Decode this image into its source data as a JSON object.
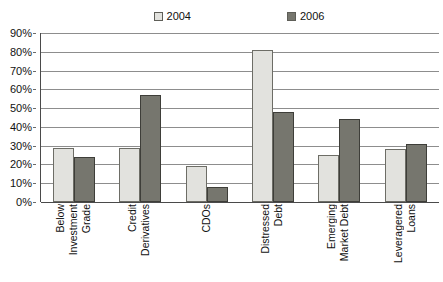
{
  "chart_data": {
    "type": "bar",
    "title": "",
    "subtitle": "",
    "xlabel": "",
    "ylabel": "",
    "ylim": [
      0,
      90
    ],
    "ytick_labels": [
      "90%",
      "80%",
      "70%",
      "60%",
      "50%",
      "40%",
      "30%",
      "20%",
      "10%",
      "0%"
    ],
    "ytick_values": [
      90,
      80,
      70,
      60,
      50,
      40,
      30,
      20,
      10,
      0
    ],
    "grid": true,
    "legend_position": "top",
    "categories": [
      "Below Investment Grade",
      "Credit Derivatives",
      "CDOs",
      "Distressed Debt",
      "Emerging Market Debt",
      "Leveragered Loans"
    ],
    "category_lines": [
      [
        "Below",
        "Investment",
        "Grade"
      ],
      [
        "Credit",
        "Derivatives"
      ],
      [
        "CDOs"
      ],
      [
        "Distressed",
        "Debt"
      ],
      [
        "Emerging",
        "Market Debt"
      ],
      [
        "Leveragered",
        "Loans"
      ]
    ],
    "series": [
      {
        "name": "2004",
        "color": "#e2e2de",
        "values": [
          29,
          29,
          19,
          81,
          25,
          28
        ]
      },
      {
        "name": "2006",
        "color": "#76766e",
        "values": [
          24,
          57,
          8,
          48,
          44,
          31
        ]
      }
    ]
  },
  "legend": {
    "entries": [
      {
        "label": "2004"
      },
      {
        "label": "2006"
      }
    ]
  },
  "colors": {
    "series_2004": "#e2e2de",
    "series_2006": "#76766e",
    "gridline": "#8d8d8d",
    "axis": "#4a4a4a",
    "text": "#111111",
    "background": "#ffffff"
  }
}
